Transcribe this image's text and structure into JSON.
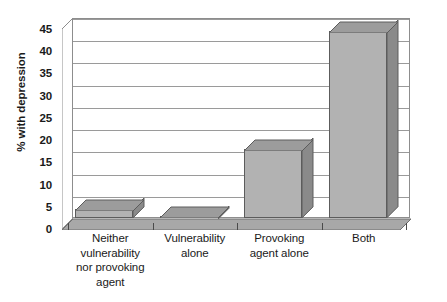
{
  "chart_data": {
    "type": "bar",
    "title": "",
    "xlabel": "",
    "ylabel": "% with depression",
    "categories": [
      "Neither vulnerability nor provoking agent",
      "Vulnerability alone",
      "Provoking agent alone",
      "Both"
    ],
    "category_lines": [
      [
        "Neither",
        "vulnerability",
        "nor provoking",
        "agent"
      ],
      [
        "Vulnerability",
        "alone"
      ],
      [
        "Provoking",
        "agent alone"
      ],
      [
        "Both"
      ]
    ],
    "values": [
      2,
      0.5,
      15.5,
      42
    ],
    "ylim": [
      0,
      45
    ],
    "yticks": [
      0,
      5,
      10,
      15,
      20,
      25,
      30,
      35,
      40,
      45
    ],
    "ytick_labels": [
      "0",
      "5",
      "10",
      "15",
      "20",
      "25",
      "30",
      "35",
      "40",
      "45"
    ],
    "grid": true,
    "legend": null,
    "style": "3d-column",
    "colors": {
      "bar_front": "#b2b2b2",
      "bar_side": "#8a8a8a",
      "bar_top": "#9c9c9c",
      "bar_outline": "#5c5c5c",
      "floor": "#a8a8a8",
      "wall_background": "#ffffff",
      "gridline": "#9a9a9a",
      "axis": "#4a4a4a",
      "text": "#1a1a1a"
    }
  }
}
